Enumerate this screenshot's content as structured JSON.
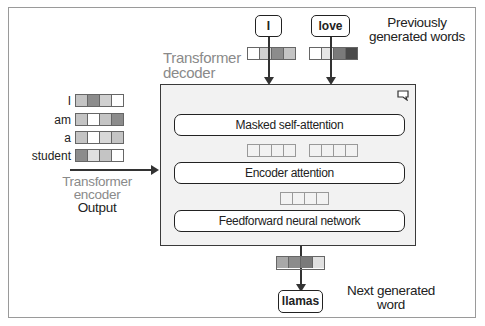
{
  "labels": {
    "decoder_title_line1": "Transformer",
    "decoder_title_line2": "decoder",
    "previously_line1": "Previously",
    "previously_line2": "generated words",
    "encoder_line1": "Transformer",
    "encoder_line2": "encoder",
    "encoder_line3": "Output",
    "next_line1": "Next generated",
    "next_line2": "word"
  },
  "previous_words": [
    {
      "text": "I",
      "vector": [
        "#ffffff",
        "#d0d0d0",
        "#8c8c8c",
        "#c4c4c4"
      ]
    },
    {
      "text": "love",
      "vector": [
        "#ffffff",
        "#e6e6e6",
        "#7a7a7a",
        "#4a4a4a"
      ]
    }
  ],
  "encoder_words": [
    {
      "text": "I",
      "vector": [
        "#c4c4c4",
        "#8c8c8c",
        "#d0d0d0",
        "#ffffff"
      ]
    },
    {
      "text": "am",
      "vector": [
        "#c4c4c4",
        "#ffffff",
        "#c4c4c4",
        "#8c8c8c"
      ]
    },
    {
      "text": "a",
      "vector": [
        "#c4c4c4",
        "#ffffff",
        "#d8d8d8",
        "#c4c4c4"
      ]
    },
    {
      "text": "student",
      "vector": [
        "#8c8c8c",
        "#e0e0e0",
        "#c4c4c4",
        "#ffffff"
      ]
    }
  ],
  "decoder_layers": [
    {
      "label": "Masked self-attention"
    },
    {
      "label": "Encoder attention"
    },
    {
      "label": "Feedforward neural network"
    }
  ],
  "output": {
    "word": "llamas",
    "vector": [
      "#a8a8a8",
      "#8c8c8c",
      "#7a7a7a",
      "#e0e0e0"
    ]
  }
}
